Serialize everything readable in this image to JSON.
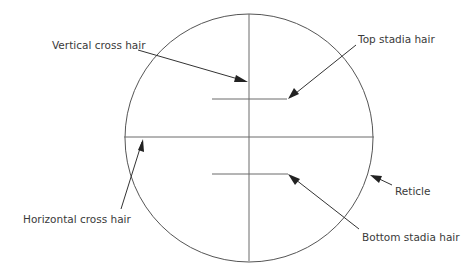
{
  "labels": {
    "vertical_cross_hair": "Vertical cross hair",
    "top_stadia_hair": "Top stadia hair",
    "horizontal_cross_hair": "Horizontal cross hair",
    "bottom_stadia_hair": "Bottom stadia hair",
    "reticle": "Reticle"
  },
  "colors": {
    "line": "#555555",
    "text": "#3a3a3a",
    "background": "#ffffff"
  }
}
